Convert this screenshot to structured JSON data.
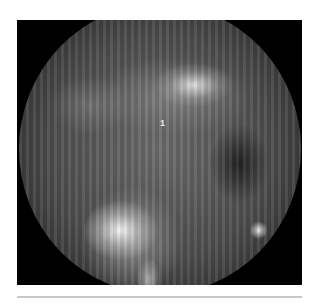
{
  "figure": {
    "type": "endoscopic-photograph",
    "tone": "grayscale",
    "annotation_label": "1"
  },
  "colors": {
    "background": "#ffffff",
    "frame": "#000000",
    "rule": "#c8c8c8"
  }
}
